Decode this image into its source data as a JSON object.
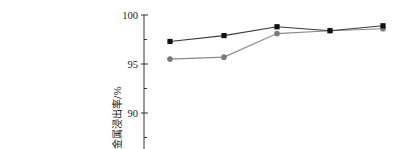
{
  "chart_data": {
    "type": "line",
    "title": "",
    "xlabel": "",
    "ylabel": "金属浸出率/%",
    "ylim": [
      87.5,
      100
    ],
    "yticks": [
      100,
      95,
      90
    ],
    "minor_yticks": [
      97.5,
      92.5,
      87.5
    ],
    "grid": false,
    "legend": null,
    "x": [
      1,
      2,
      3,
      4,
      5
    ],
    "series": [
      {
        "name": "square-marker series",
        "marker": "square",
        "color": "#111111",
        "line_color": "#3a3a3a",
        "values": [
          97.3,
          97.9,
          98.8,
          98.4,
          98.9
        ]
      },
      {
        "name": "circle-marker series",
        "marker": "circle",
        "color": "#7a7a7a",
        "line_color": "#8a8a8a",
        "values": [
          95.5,
          95.7,
          98.1,
          98.4,
          98.6
        ]
      }
    ]
  },
  "layout": {
    "axis_x": 144,
    "y_top_px": 15,
    "px_per_unit": 9.8,
    "x_px": [
      170,
      224,
      277,
      330,
      383
    ]
  }
}
